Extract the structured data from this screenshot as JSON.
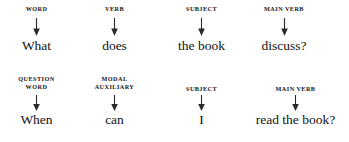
{
  "diagram": {
    "type": "sentence-structure-annotation",
    "rows": [
      {
        "id": "row-1",
        "sentence": "What does the book discuss?",
        "cells": [
          {
            "tag_line1": "WORD",
            "tag_line2": "",
            "word": "What"
          },
          {
            "tag_line1": "VERB",
            "tag_line2": "",
            "word": "does"
          },
          {
            "tag_line1": "SUBJECT",
            "tag_line2": "",
            "word": "the book"
          },
          {
            "tag_line1": "MAIN VERB",
            "tag_line2": "",
            "word": "discuss?"
          }
        ]
      },
      {
        "id": "row-2",
        "sentence": "When can I read the book?",
        "cells": [
          {
            "tag_line1": "QUESTION",
            "tag_line2": "WORD",
            "word": "When"
          },
          {
            "tag_line1": "MODAL",
            "tag_line2": "AUXILIARY",
            "word": "can"
          },
          {
            "tag_line1": "SUBJECT",
            "tag_line2": "",
            "word": "I"
          },
          {
            "tag_line1": "MAIN VERB",
            "tag_line2": "",
            "word": "read the book?"
          }
        ]
      }
    ],
    "colors": {
      "background": "#ffffff",
      "text": "#111111",
      "arrow": "#2b2b2b"
    }
  }
}
